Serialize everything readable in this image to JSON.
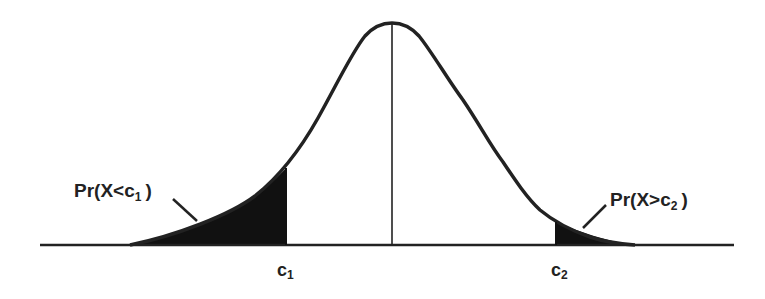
{
  "diagram": {
    "type": "normal-distribution-two-tail",
    "colors": {
      "background": "#ffffff",
      "ink": "#222222",
      "shade": "#111111"
    },
    "labels": {
      "left_tail": {
        "prefix": "Pr(X<c",
        "sub": "1",
        "suffix": ")"
      },
      "right_tail": {
        "prefix": "Pr(X>c",
        "sub": "2",
        "suffix": ")"
      },
      "c1": {
        "base": "c",
        "sub": "1"
      },
      "c2": {
        "base": "c",
        "sub": "2"
      }
    }
  }
}
